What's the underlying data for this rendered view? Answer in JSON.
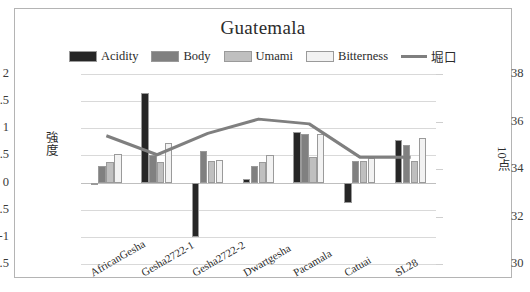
{
  "chart": {
    "title": "Guatemala",
    "left_axis_label": "強度",
    "right_axis_label": "10点"
  },
  "legend": [
    {
      "name": "Acidity",
      "color": "#262626",
      "type": "bar"
    },
    {
      "name": "Body",
      "color": "#808080",
      "type": "bar"
    },
    {
      "name": "Umami",
      "color": "#bfbfbf",
      "type": "bar"
    },
    {
      "name": "Bitterness",
      "color": "#f2f2f2",
      "type": "bar"
    },
    {
      "name": "堀口",
      "color": "#7f7f7f",
      "type": "line"
    }
  ],
  "chart_data": {
    "type": "bar",
    "title": "Guatemala",
    "xlabel": "",
    "ylabel": "強度",
    "y2label": "10点",
    "ylim": [
      -1.5,
      2
    ],
    "yticks": [
      -1.5,
      -1,
      -0.5,
      0,
      0.5,
      1,
      1.5,
      2
    ],
    "y2lim": [
      30,
      38
    ],
    "y2ticks": [
      30,
      32,
      34,
      36,
      38
    ],
    "grid": true,
    "legend_position": "top",
    "categories": [
      "AfricanGesha",
      "Gesha2722-1",
      "Gesha2722-2",
      "Dwartgesha",
      "Pacamala",
      "Catuai",
      "SL28"
    ],
    "series": [
      {
        "name": "Acidity",
        "axis": "left",
        "type": "bar",
        "color": "#262626",
        "values": [
          -0.05,
          1.65,
          -1.0,
          0.07,
          0.93,
          -0.38,
          0.78
        ]
      },
      {
        "name": "Body",
        "axis": "left",
        "type": "bar",
        "color": "#808080",
        "values": [
          0.3,
          0.5,
          0.58,
          0.3,
          0.9,
          0.4,
          0.7
        ]
      },
      {
        "name": "Umami",
        "axis": "left",
        "type": "bar",
        "color": "#bfbfbf",
        "values": [
          0.38,
          0.38,
          0.4,
          0.38,
          0.48,
          0.4,
          0.4
        ]
      },
      {
        "name": "Bitterness",
        "axis": "left",
        "type": "bar",
        "color": "#f2f2f2",
        "values": [
          0.53,
          0.73,
          0.42,
          0.5,
          0.9,
          0.45,
          0.82
        ]
      },
      {
        "name": "堀口",
        "axis": "right",
        "type": "line",
        "color": "#7f7f7f",
        "values": [
          35.4,
          34.6,
          35.5,
          36.1,
          35.9,
          34.5,
          34.5
        ]
      }
    ]
  }
}
